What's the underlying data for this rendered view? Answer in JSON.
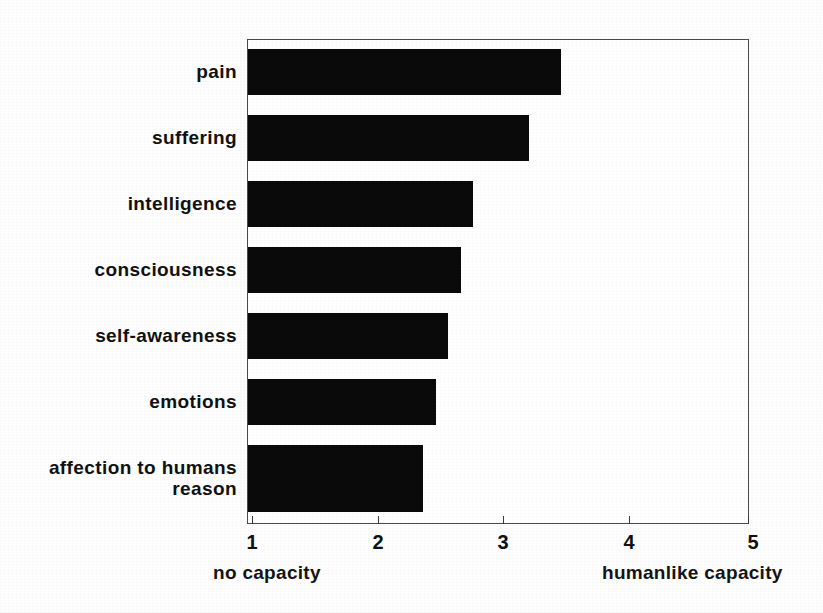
{
  "chart_data": {
    "type": "bar",
    "orientation": "horizontal",
    "title": "",
    "subtitle": "",
    "xlabel": "",
    "ylabel": "",
    "categories": [
      "pain",
      "suffering",
      "intelligence",
      "consciousness",
      "self-awareness",
      "emotions",
      "affection to humans",
      "reason"
    ],
    "values": [
      3.5,
      3.25,
      2.8,
      2.7,
      2.6,
      2.5,
      2.4,
      2.4
    ],
    "xlim": [
      1,
      5
    ],
    "xticks": [
      1,
      2,
      3,
      4,
      5
    ],
    "xtick_labels": [
      "1",
      "2",
      "3",
      "4",
      "5"
    ],
    "grid": false,
    "legend": null,
    "bar_color": "#0a0a0a",
    "frame_color": "#4a4a4a",
    "background_color": "#ffffff",
    "annotations": [
      {
        "text": "no capacity",
        "position": "below-axis-left",
        "value": 1
      },
      {
        "text": "humanlike capacity",
        "position": "below-axis-right",
        "value": 5
      }
    ]
  },
  "axis": {
    "scale_low_label": "no capacity",
    "scale_high_label": "humanlike capacity"
  }
}
